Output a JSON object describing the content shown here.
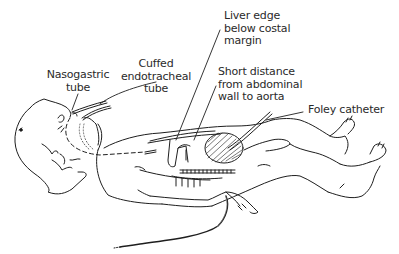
{
  "diagram": {
    "colors": {
      "ink": "#1e1e1e",
      "text": "#2a2a2a",
      "background": "#ffffff"
    },
    "labels": {
      "nasogastric": {
        "line1": "Nasogastric",
        "line2": "tube"
      },
      "endotracheal": {
        "line1": "Cuffed",
        "line2": "endotracheal",
        "line3": "tube"
      },
      "liver": {
        "line1": "Liver edge",
        "line2": "below costal",
        "line3": "margin"
      },
      "aorta": {
        "line1": "Short distance",
        "line2": "from abdominal",
        "line3": "wall to aorta"
      },
      "foley": {
        "line1": "Foley catheter"
      }
    }
  }
}
